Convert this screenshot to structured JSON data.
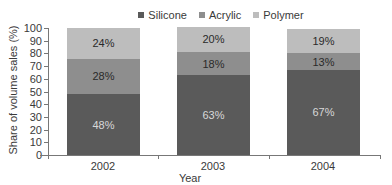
{
  "chart_data": {
    "type": "bar",
    "stacked": true,
    "title": "",
    "xlabel": "Year",
    "ylabel": "Share of volume sales (%)",
    "ylim": [
      0,
      100
    ],
    "yticks": [
      0,
      10,
      20,
      30,
      40,
      50,
      60,
      70,
      80,
      90,
      100
    ],
    "categories": [
      "2002",
      "2003",
      "2004"
    ],
    "series": [
      {
        "name": "Silicone",
        "values": [
          48,
          63,
          67
        ],
        "labels": [
          "48%",
          "63%",
          "67%"
        ],
        "color": "#5a5a5a",
        "label_color": "#d8d8d8"
      },
      {
        "name": "Acrylic",
        "values": [
          28,
          18,
          13
        ],
        "labels": [
          "28%",
          "18%",
          "13%"
        ],
        "color": "#8e8e8e",
        "label_color": "#2a2a2a"
      },
      {
        "name": "Polymer",
        "values": [
          24,
          20,
          19
        ],
        "labels": [
          "24%",
          "20%",
          "19%"
        ],
        "color": "#bdbdbd",
        "label_color": "#2a2a2a"
      }
    ],
    "legend_position": "top",
    "grid": false
  },
  "legend": {
    "items": [
      {
        "label": "Silicone",
        "color": "#5a5a5a"
      },
      {
        "label": "Acrylic",
        "color": "#8e8e8e"
      },
      {
        "label": "Polymer",
        "color": "#bdbdbd"
      }
    ]
  },
  "axes": {
    "x_title": "Year",
    "y_title": "Share of volume sales (%)"
  }
}
